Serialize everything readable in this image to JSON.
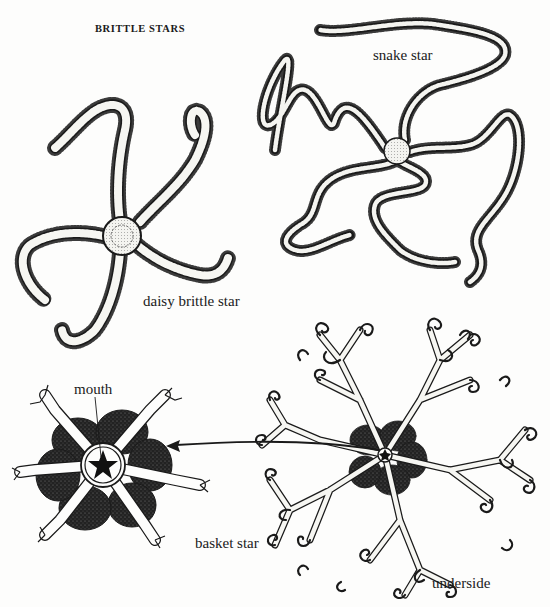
{
  "plate": {
    "title": "BRITTLE STARS",
    "background": "#fdfdfc",
    "ink": "#1a1a1a"
  },
  "figures": [
    {
      "id": "daisy-brittle-star",
      "label": "daisy brittle star"
    },
    {
      "id": "snake-star",
      "label": "snake star"
    },
    {
      "id": "basket-star-detail",
      "label": "basket star",
      "callout": "mouth"
    },
    {
      "id": "basket-star-underside",
      "label": "underside"
    }
  ]
}
